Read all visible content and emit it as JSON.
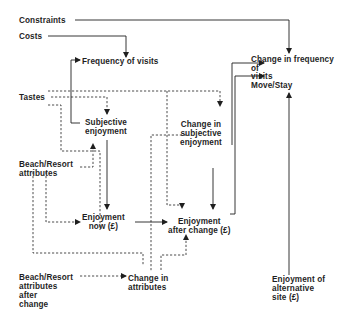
{
  "diagram": {
    "type": "flow",
    "nodes": {
      "constraints": "Constraints",
      "costs": "Costs",
      "frequency_of_visits": "Frequency of visits",
      "change_in_frequency": "Change in frequency\nof\nvisits\nMove/Stay",
      "tastes": "Tastes",
      "subjective_enjoyment": "Subjective\nenjoyment",
      "change_in_subjective_enjoyment": "Change in\nsubjective\nenjoyment",
      "beach_resort_attributes": "Beach/Resort\nattributes",
      "enjoyment_now": "Enjoyment\nnow (£)",
      "enjoyment_after_change": "Enjoyment\nafter change (£)",
      "beach_resort_attributes_after_change": "Beach/Resort\nattributes\nafter\nchange",
      "change_in_attributes": "Change in\nattributes",
      "enjoyment_alternative_site": "Enjoyment of\nalternative\nsite (£)"
    },
    "edges": [
      {
        "from": "Constraints",
        "to": "Change in frequency of visits",
        "style": "solid"
      },
      {
        "from": "Costs",
        "to": "Frequency of visits",
        "style": "solid"
      },
      {
        "from": "Subjective enjoyment",
        "to": "Frequency of visits",
        "style": "solid"
      },
      {
        "from": "Tastes",
        "to": "Subjective enjoyment",
        "style": "dashed"
      },
      {
        "from": "Tastes",
        "to": "Change in subjective enjoyment",
        "style": "dashed"
      },
      {
        "from": "Tastes",
        "to": "Enjoyment after change",
        "style": "dashed"
      },
      {
        "from": "Beach/Resort attributes",
        "to": "Subjective enjoyment",
        "style": "dashed"
      },
      {
        "from": "Beach/Resort attributes",
        "to": "Enjoyment now",
        "style": "dashed"
      },
      {
        "from": "Beach/Resort attributes",
        "to": "Change in attributes",
        "style": "dashed"
      },
      {
        "from": "Subjective enjoyment",
        "to": "Enjoyment now",
        "style": "solid"
      },
      {
        "from": "Enjoyment now",
        "to": "Enjoyment after change",
        "style": "solid"
      },
      {
        "from": "Change in subjective enjoyment",
        "to": "Enjoyment after change",
        "style": "solid"
      },
      {
        "from": "Change in subjective enjoyment",
        "to": "Change in frequency of visits",
        "style": "solid"
      },
      {
        "from": "Enjoyment after change",
        "to": "Change in frequency of visits",
        "style": "solid"
      },
      {
        "from": "Beach/Resort attributes after change",
        "to": "Change in attributes",
        "style": "dashed"
      },
      {
        "from": "Change in attributes",
        "to": "Enjoyment after change",
        "style": "dashed"
      },
      {
        "from": "Change in attributes",
        "to": "Change in subjective enjoyment",
        "style": "dashed"
      },
      {
        "from": "Enjoyment of alternative site",
        "to": "Change in frequency of visits",
        "style": "solid"
      }
    ],
    "colors": {
      "line": "#1f1f1f",
      "text": "#1f1f1f",
      "background": "#ffffff"
    }
  }
}
